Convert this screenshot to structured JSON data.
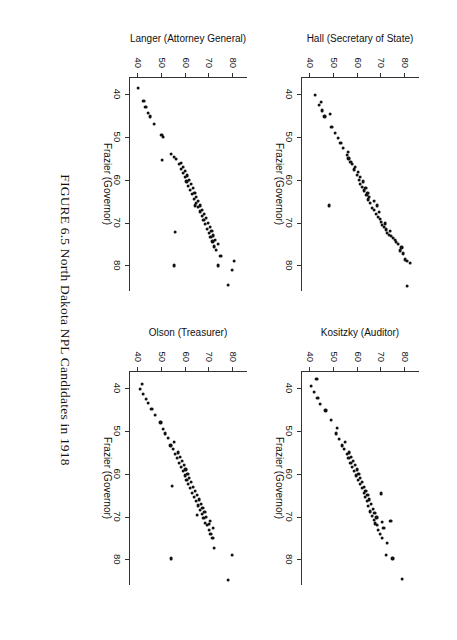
{
  "caption": "FIGURE 6.5 North Dakota NPL Candidates in 1918",
  "shared": {
    "xlabel": "Frazier (Governor)",
    "xticks": [
      "40",
      "50",
      "60",
      "70",
      "80"
    ],
    "yticks": [
      "40",
      "50",
      "60",
      "70",
      "80"
    ]
  },
  "chart_data": {
    "type": "scatter",
    "title": "FIGURE 6.5 North Dakota NPL Candidates in 1918",
    "layout": "2x2 grid of scatterplots, shared x variable",
    "grid": false,
    "legend": "none",
    "xlabel": "Frazier (Governor)",
    "xlim": [
      36,
      86
    ],
    "ylim": [
      36,
      86
    ],
    "xticks": [
      40,
      50,
      60,
      70,
      80
    ],
    "yticks": [
      40,
      50,
      60,
      70,
      80
    ],
    "panels": [
      {
        "index": 0,
        "position": "top-left",
        "ylabel": "Hall (Secretary of State)",
        "xlabel": "Frazier (Governor)",
        "points": [
          [
            84.8,
            81.0
          ],
          [
            79.4,
            82.2
          ],
          [
            79.0,
            80.9
          ],
          [
            78.6,
            80.0
          ],
          [
            77.2,
            79.2
          ],
          [
            76.5,
            78.0
          ],
          [
            75.8,
            78.6
          ],
          [
            75.0,
            77.0
          ],
          [
            74.6,
            76.2
          ],
          [
            74.1,
            75.8
          ],
          [
            73.6,
            75.0
          ],
          [
            73.1,
            74.1
          ],
          [
            72.8,
            73.2
          ],
          [
            72.4,
            72.6
          ],
          [
            72.0,
            73.8
          ],
          [
            71.6,
            72.0
          ],
          [
            71.0,
            71.2
          ],
          [
            70.6,
            70.4
          ],
          [
            70.2,
            71.6
          ],
          [
            69.8,
            70.0
          ],
          [
            69.2,
            69.4
          ],
          [
            68.6,
            68.5
          ],
          [
            68.0,
            67.8
          ],
          [
            67.6,
            69.0
          ],
          [
            67.0,
            67.0
          ],
          [
            66.5,
            66.2
          ],
          [
            66.0,
            68.2
          ],
          [
            65.4,
            65.4
          ],
          [
            65.0,
            66.8
          ],
          [
            64.6,
            64.6
          ],
          [
            64.0,
            65.0
          ],
          [
            63.5,
            63.8
          ],
          [
            63.0,
            64.2
          ],
          [
            62.5,
            62.8
          ],
          [
            62.0,
            63.4
          ],
          [
            61.6,
            62.0
          ],
          [
            61.0,
            61.2
          ],
          [
            60.4,
            62.4
          ],
          [
            60.0,
            60.5
          ],
          [
            59.4,
            61.0
          ],
          [
            58.8,
            59.8
          ],
          [
            58.2,
            60.2
          ],
          [
            57.6,
            58.6
          ],
          [
            57.0,
            59.0
          ],
          [
            56.4,
            57.8
          ],
          [
            55.8,
            57.0
          ],
          [
            55.0,
            56.2
          ],
          [
            54.2,
            55.4
          ],
          [
            53.5,
            56.0
          ],
          [
            52.6,
            54.0
          ],
          [
            51.4,
            52.8
          ],
          [
            50.2,
            51.6
          ],
          [
            49.0,
            50.4
          ],
          [
            47.6,
            49.0
          ],
          [
            45.2,
            46.0
          ],
          [
            44.6,
            48.2
          ],
          [
            43.8,
            45.0
          ],
          [
            42.6,
            43.6
          ],
          [
            41.8,
            44.4
          ],
          [
            40.2,
            42.0
          ],
          [
            66.0,
            47.8
          ]
        ]
      },
      {
        "index": 1,
        "position": "top-right",
        "ylabel": "Kositzky (Auditor)",
        "xlabel": "Frazier (Governor)",
        "points": [
          [
            84.6,
            79.0
          ],
          [
            79.8,
            74.8
          ],
          [
            79.0,
            72.0
          ],
          [
            76.2,
            72.4
          ],
          [
            75.0,
            70.4
          ],
          [
            74.0,
            69.6
          ],
          [
            73.2,
            68.8
          ],
          [
            72.6,
            71.0
          ],
          [
            72.0,
            68.2
          ],
          [
            71.6,
            67.4
          ],
          [
            71.2,
            70.2
          ],
          [
            70.8,
            66.8
          ],
          [
            70.2,
            68.0
          ],
          [
            69.8,
            66.0
          ],
          [
            69.2,
            67.2
          ],
          [
            68.8,
            65.2
          ],
          [
            68.2,
            66.4
          ],
          [
            67.6,
            64.6
          ],
          [
            67.0,
            65.8
          ],
          [
            66.4,
            64.0
          ],
          [
            66.0,
            65.0
          ],
          [
            65.4,
            63.2
          ],
          [
            65.0,
            64.2
          ],
          [
            64.4,
            62.6
          ],
          [
            64.0,
            63.4
          ],
          [
            63.4,
            61.8
          ],
          [
            63.0,
            62.8
          ],
          [
            62.4,
            61.0
          ],
          [
            62.0,
            62.0
          ],
          [
            61.4,
            60.2
          ],
          [
            61.0,
            61.2
          ],
          [
            60.4,
            59.4
          ],
          [
            60.0,
            60.4
          ],
          [
            59.4,
            58.6
          ],
          [
            59.0,
            59.6
          ],
          [
            58.4,
            57.8
          ],
          [
            58.0,
            58.8
          ],
          [
            57.4,
            57.0
          ],
          [
            57.0,
            58.0
          ],
          [
            56.4,
            56.2
          ],
          [
            56.0,
            57.2
          ],
          [
            55.4,
            55.4
          ],
          [
            55.0,
            56.4
          ],
          [
            54.2,
            54.2
          ],
          [
            53.4,
            53.4
          ],
          [
            52.6,
            54.8
          ],
          [
            51.8,
            52.0
          ],
          [
            50.6,
            50.8
          ],
          [
            49.2,
            51.2
          ],
          [
            47.4,
            48.6
          ],
          [
            45.2,
            46.4
          ],
          [
            43.6,
            44.2
          ],
          [
            42.2,
            43.0
          ],
          [
            40.8,
            41.6
          ],
          [
            39.4,
            40.2
          ],
          [
            37.8,
            42.6
          ],
          [
            71.0,
            74.0
          ],
          [
            64.6,
            69.8
          ]
        ]
      },
      {
        "index": 2,
        "position": "bottom-left",
        "ylabel": "Langer (Attorney General)",
        "xlabel": "Frazier (Governor)",
        "points": [
          [
            84.6,
            78.0
          ],
          [
            81.0,
            79.6
          ],
          [
            80.0,
            73.6
          ],
          [
            79.0,
            80.4
          ],
          [
            77.8,
            74.8
          ],
          [
            76.4,
            73.0
          ],
          [
            75.6,
            72.2
          ],
          [
            75.0,
            73.8
          ],
          [
            74.4,
            71.4
          ],
          [
            74.0,
            72.6
          ],
          [
            73.4,
            70.6
          ],
          [
            73.0,
            71.8
          ],
          [
            72.4,
            70.0
          ],
          [
            72.0,
            71.0
          ],
          [
            71.4,
            69.2
          ],
          [
            71.0,
            70.2
          ],
          [
            70.4,
            68.4
          ],
          [
            70.0,
            69.4
          ],
          [
            69.4,
            67.6
          ],
          [
            69.0,
            68.6
          ],
          [
            68.4,
            66.8
          ],
          [
            68.0,
            67.8
          ],
          [
            67.4,
            66.0
          ],
          [
            67.0,
            67.0
          ],
          [
            66.4,
            65.2
          ],
          [
            66.0,
            66.2
          ],
          [
            65.4,
            64.4
          ],
          [
            65.0,
            65.4
          ],
          [
            64.4,
            63.6
          ],
          [
            64.0,
            64.6
          ],
          [
            63.4,
            62.8
          ],
          [
            63.0,
            63.8
          ],
          [
            62.4,
            62.0
          ],
          [
            62.0,
            63.0
          ],
          [
            61.4,
            61.2
          ],
          [
            61.0,
            62.2
          ],
          [
            60.4,
            60.4
          ],
          [
            60.0,
            61.4
          ],
          [
            59.4,
            59.6
          ],
          [
            59.0,
            60.6
          ],
          [
            58.4,
            58.8
          ],
          [
            58.0,
            59.8
          ],
          [
            57.4,
            58.0
          ],
          [
            57.0,
            59.0
          ],
          [
            56.4,
            57.2
          ],
          [
            56.0,
            58.2
          ],
          [
            55.2,
            56.0
          ],
          [
            54.6,
            55.0
          ],
          [
            54.0,
            54.0
          ],
          [
            50.0,
            50.6
          ],
          [
            49.6,
            49.8
          ],
          [
            47.0,
            46.8
          ],
          [
            45.2,
            45.0
          ],
          [
            44.4,
            44.2
          ],
          [
            43.0,
            43.0
          ],
          [
            41.6,
            42.2
          ],
          [
            38.6,
            40.0
          ],
          [
            80.0,
            55.0
          ],
          [
            72.2,
            55.4
          ],
          [
            66.0,
            64.0
          ],
          [
            55.4,
            50.0
          ]
        ]
      },
      {
        "index": 3,
        "position": "bottom-right",
        "ylabel": "Olson (Treasurer)",
        "xlabel": "Frazier (Governor)",
        "points": [
          [
            84.8,
            78.0
          ],
          [
            79.0,
            79.8
          ],
          [
            77.4,
            72.0
          ],
          [
            75.0,
            71.4
          ],
          [
            74.0,
            70.6
          ],
          [
            73.2,
            69.8
          ],
          [
            72.6,
            71.6
          ],
          [
            72.0,
            69.0
          ],
          [
            71.4,
            68.2
          ],
          [
            71.0,
            70.2
          ],
          [
            70.4,
            67.6
          ],
          [
            70.0,
            68.8
          ],
          [
            69.4,
            66.8
          ],
          [
            69.0,
            68.0
          ],
          [
            68.4,
            66.0
          ],
          [
            68.0,
            67.2
          ],
          [
            67.4,
            65.2
          ],
          [
            67.0,
            66.4
          ],
          [
            66.4,
            64.4
          ],
          [
            66.0,
            65.6
          ],
          [
            65.4,
            63.6
          ],
          [
            65.0,
            64.8
          ],
          [
            64.4,
            62.8
          ],
          [
            64.0,
            64.0
          ],
          [
            63.4,
            62.0
          ],
          [
            63.0,
            63.2
          ],
          [
            62.4,
            61.2
          ],
          [
            62.0,
            62.4
          ],
          [
            61.4,
            60.4
          ],
          [
            61.0,
            61.6
          ],
          [
            60.4,
            59.6
          ],
          [
            60.0,
            60.8
          ],
          [
            59.4,
            58.8
          ],
          [
            59.0,
            60.0
          ],
          [
            58.4,
            58.0
          ],
          [
            58.0,
            59.2
          ],
          [
            57.4,
            57.2
          ],
          [
            57.0,
            58.4
          ],
          [
            56.4,
            56.4
          ],
          [
            56.0,
            57.6
          ],
          [
            55.4,
            55.6
          ],
          [
            55.0,
            56.8
          ],
          [
            54.2,
            54.6
          ],
          [
            53.4,
            53.6
          ],
          [
            52.6,
            55.0
          ],
          [
            51.6,
            52.4
          ],
          [
            50.6,
            51.4
          ],
          [
            49.6,
            50.4
          ],
          [
            48.0,
            49.4
          ],
          [
            46.2,
            47.0
          ],
          [
            44.8,
            45.6
          ],
          [
            43.4,
            44.0
          ],
          [
            42.6,
            43.2
          ],
          [
            41.4,
            42.0
          ],
          [
            40.2,
            40.6
          ],
          [
            39.0,
            41.4
          ],
          [
            79.8,
            54.0
          ],
          [
            71.8,
            70.0
          ],
          [
            69.6,
            65.0
          ],
          [
            62.8,
            54.2
          ]
        ]
      }
    ]
  }
}
